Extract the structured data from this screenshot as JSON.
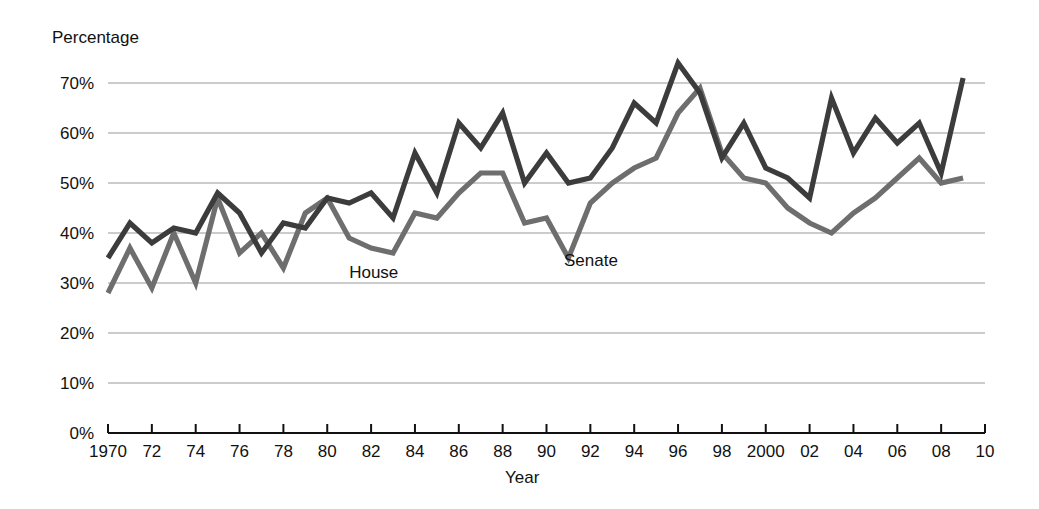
{
  "chart_data": {
    "type": "line",
    "title": "",
    "xlabel": "Year",
    "ylabel": "Percentage",
    "xlim": [
      1970,
      2010
    ],
    "ylim": [
      0,
      70
    ],
    "grid": true,
    "legend_position": "inline-labels",
    "y_ticks": [
      0,
      10,
      20,
      30,
      40,
      50,
      60,
      70
    ],
    "y_tick_labels": [
      "0%",
      "10%",
      "20%",
      "30%",
      "40%",
      "50%",
      "60%",
      "70%"
    ],
    "x_ticks": [
      1970,
      1972,
      1974,
      1976,
      1978,
      1980,
      1982,
      1984,
      1986,
      1988,
      1990,
      1992,
      1994,
      1996,
      1998,
      2000,
      2002,
      2004,
      2006,
      2008,
      2010
    ],
    "x_tick_labels": [
      "1970",
      "72",
      "74",
      "76",
      "78",
      "80",
      "82",
      "84",
      "86",
      "88",
      "90",
      "92",
      "94",
      "96",
      "98",
      "2000",
      "02",
      "04",
      "06",
      "08",
      "10"
    ],
    "x": [
      1970,
      1971,
      1972,
      1973,
      1974,
      1975,
      1976,
      1977,
      1978,
      1979,
      1980,
      1981,
      1982,
      1983,
      1984,
      1985,
      1986,
      1987,
      1988,
      1989,
      1990,
      1991,
      1992,
      1993,
      1994,
      1995,
      1996,
      1997,
      1998,
      1999,
      2000,
      2001,
      2002,
      2003,
      2004,
      2005,
      2006,
      2007,
      2008,
      2009
    ],
    "series": [
      {
        "name": "House",
        "color": "#3c3c3c",
        "label_x": 1981,
        "label_y": 31,
        "values": [
          35,
          42,
          38,
          41,
          40,
          48,
          44,
          36,
          42,
          41,
          47,
          46,
          48,
          43,
          56,
          48,
          62,
          57,
          64,
          50,
          56,
          50,
          51,
          57,
          66,
          62,
          74,
          68,
          55,
          62,
          53,
          51,
          47,
          67,
          56,
          63,
          58,
          62,
          52,
          71
        ],
        "annotations": []
      },
      {
        "name": "Senate",
        "color": "#6e6e6e",
        "label_x": 1990.8,
        "label_y": 33.5,
        "values": [
          28,
          37,
          29,
          40,
          30,
          47,
          36,
          40,
          33,
          44,
          47,
          39,
          37,
          36,
          44,
          43,
          48,
          52,
          52,
          42,
          43,
          35,
          46,
          50,
          53,
          55,
          64,
          69,
          56,
          51,
          50,
          45,
          42,
          40,
          44,
          47,
          51,
          55,
          50,
          51
        ],
        "annotations": []
      }
    ]
  },
  "labels": {
    "y_axis_title": "Percentage",
    "x_axis_title": "Year",
    "house": "House",
    "senate": "Senate"
  }
}
